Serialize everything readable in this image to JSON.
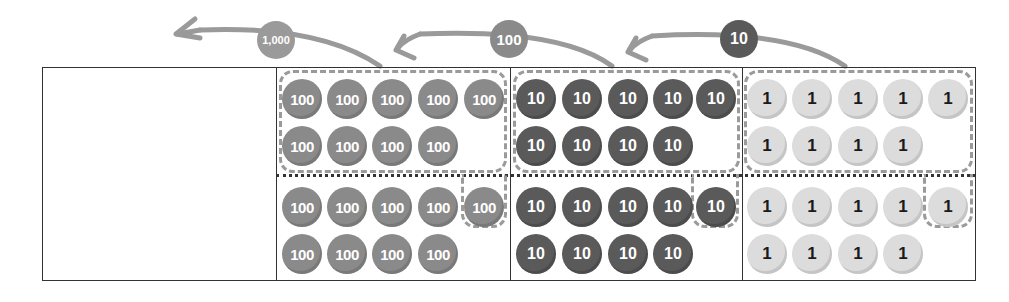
{
  "diagram": {
    "title": "",
    "columns": [
      {
        "place": "thousands",
        "tokens_top": [],
        "tokens_bottom": []
      },
      {
        "place": "hundreds",
        "token_label": "100",
        "top_row1": [
          "100",
          "100",
          "100",
          "100",
          "100"
        ],
        "top_row2": [
          "100",
          "100",
          "100",
          "100"
        ],
        "bottom_row1": [
          "100",
          "100",
          "100",
          "100",
          "100"
        ],
        "bottom_row2": [
          "100",
          "100",
          "100",
          "100"
        ]
      },
      {
        "place": "tens",
        "token_label": "10",
        "top_row1": [
          "10",
          "10",
          "10",
          "10",
          "10"
        ],
        "top_row2": [
          "10",
          "10",
          "10",
          "10"
        ],
        "bottom_row1": [
          "10",
          "10",
          "10",
          "10",
          "10"
        ],
        "bottom_row2": [
          "10",
          "10",
          "10",
          "10"
        ]
      },
      {
        "place": "ones",
        "token_label": "1",
        "top_row1": [
          "1",
          "1",
          "1",
          "1",
          "1"
        ],
        "top_row2": [
          "1",
          "1",
          "1",
          "1"
        ],
        "bottom_row1": [
          "1",
          "1",
          "1",
          "1",
          "1"
        ],
        "bottom_row2": [
          "1",
          "1",
          "1",
          "1"
        ]
      }
    ],
    "arrows": [
      {
        "label": "1,000",
        "color": "#9a9a9a"
      },
      {
        "label": "100",
        "color": "#8a8a8a"
      },
      {
        "label": "10",
        "color": "#5a5a5a"
      }
    ],
    "colors": {
      "token_100": "#8a8a8a",
      "token_10": "#5a5a5a",
      "token_1": "#dcdcdc",
      "arrow": "#9a9a9a",
      "border": "#333333",
      "group_dash": "#9a9a9a"
    }
  }
}
